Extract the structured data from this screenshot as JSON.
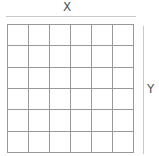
{
  "diagram": {
    "x_label": "X",
    "y_label": "Y",
    "grid": {
      "rows": 6,
      "cols": 6
    },
    "colors": {
      "grid_line": "#999999",
      "axis_line": "#c8c8c8",
      "label": "#555555"
    }
  }
}
